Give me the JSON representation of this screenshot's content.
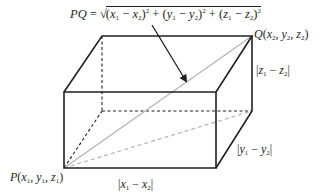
{
  "diagram": {
    "type": "3d-rectangular-box-distance",
    "formula": {
      "lhs": "PQ",
      "equals": "=",
      "radical": "√",
      "terms": [
        {
          "open": "(",
          "a": "x",
          "a_sub": "1",
          "minus": " − ",
          "b": "x",
          "b_sub": "2",
          "close": ")",
          "exp": "2"
        },
        {
          "open": "(",
          "a": "y",
          "a_sub": "1",
          "minus": " − ",
          "b": "y",
          "b_sub": "2",
          "close": ")",
          "exp": "2"
        },
        {
          "open": "(",
          "a": "z",
          "a_sub": "1",
          "minus": " − ",
          "b": "z",
          "b_sub": "2",
          "close": ")",
          "exp": "2"
        }
      ],
      "plus": " + ",
      "full_text": "PQ = √((x1 − x2)² + (y1 − y2)² + (z1 − z2)²)"
    },
    "points": {
      "P": {
        "name": "P",
        "coords": [
          "x",
          "1",
          "y",
          "1",
          "z",
          "1"
        ],
        "text": "P(x1, y1, z1)"
      },
      "Q": {
        "name": "Q",
        "coords": [
          "x",
          "2",
          "y",
          "2",
          "z",
          "2"
        ],
        "text": "Q(x2, y2, z2)"
      }
    },
    "edge_labels": {
      "x": {
        "bar": "|",
        "a": "x",
        "a_sub": "1",
        "minus": " − ",
        "b": "x",
        "b_sub": "2",
        "text": "|x1 − x2|"
      },
      "y": {
        "bar": "|",
        "a": "y",
        "a_sub": "1",
        "minus": " − ",
        "b": "y",
        "b_sub": "2",
        "text": "|y1 − y2|"
      },
      "z": {
        "bar": "|",
        "a": "z",
        "a_sub": "1",
        "minus": " − ",
        "b": "z",
        "b_sub": "2",
        "text": "|z1 − z2|"
      }
    },
    "colors": {
      "edge": "#231f20",
      "diagonal": "#b3b3b3",
      "background": "#ffffff"
    }
  }
}
